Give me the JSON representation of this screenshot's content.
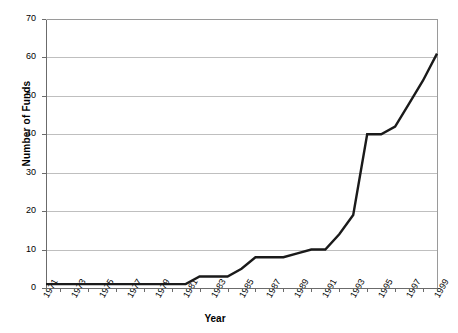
{
  "chart_data": {
    "type": "line",
    "title": "",
    "xlabel": "Year",
    "ylabel": "Number of Funds",
    "xlim": [
      1971,
      1999
    ],
    "ylim": [
      0,
      70
    ],
    "ytick_values": [
      0,
      10,
      20,
      30,
      40,
      50,
      60,
      70
    ],
    "ytick_labels": [
      "0",
      "10",
      "20",
      "30",
      "40",
      "50",
      "60",
      "70"
    ],
    "xtick_labels": [
      "1971",
      "1973",
      "1975",
      "1977",
      "1979",
      "1981",
      "1983",
      "1985",
      "1987",
      "1989",
      "1991",
      "1993",
      "1995",
      "1997",
      "1999"
    ],
    "grid": "horizontal",
    "legend": "none",
    "line_color": "#1a1a1a",
    "grid_color": "#bfbfbf",
    "frame_color": "#808080",
    "x": [
      1971,
      1972,
      1973,
      1974,
      1975,
      1976,
      1977,
      1978,
      1979,
      1980,
      1981,
      1982,
      1983,
      1984,
      1985,
      1986,
      1987,
      1988,
      1989,
      1990,
      1991,
      1992,
      1993,
      1994,
      1995,
      1996,
      1997,
      1998,
      1999
    ],
    "values": [
      1,
      1,
      1,
      1,
      1,
      1,
      1,
      1,
      1,
      1,
      1,
      3,
      3,
      3,
      5,
      8,
      8,
      8,
      9,
      10,
      10,
      14,
      19,
      40,
      40,
      42,
      48,
      54,
      61
    ],
    "series": [
      {
        "name": "Number of Funds",
        "values": [
          1,
          1,
          1,
          1,
          1,
          1,
          1,
          1,
          1,
          1,
          1,
          3,
          3,
          3,
          5,
          8,
          8,
          8,
          9,
          10,
          10,
          14,
          19,
          40,
          40,
          42,
          48,
          54,
          61
        ]
      }
    ]
  }
}
